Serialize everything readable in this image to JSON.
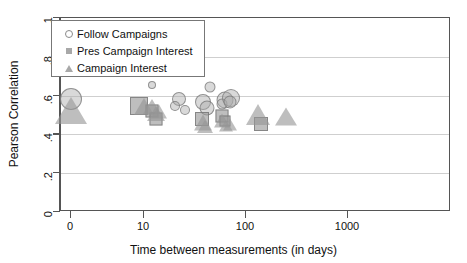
{
  "chart_data": {
    "type": "scatter",
    "title": "",
    "xlabel": "Time between measurements (in days)",
    "ylabel": "Pearson Correlation",
    "xscale": "log",
    "yscale": "linear",
    "ylim": [
      0,
      1
    ],
    "xlim": [
      0,
      1000
    ],
    "grid": "horizontal",
    "legend_position": "upper-left",
    "xticks": [
      {
        "value": 0,
        "label": "0"
      },
      {
        "value": 10,
        "label": "10"
      },
      {
        "value": 100,
        "label": "100"
      },
      {
        "value": 1000,
        "label": "1000"
      }
    ],
    "yticks": [
      {
        "value": 0,
        "label": "0"
      },
      {
        "value": 0.2,
        "label": ".2"
      },
      {
        "value": 0.4,
        "label": ".4"
      },
      {
        "value": 0.6,
        "label": ".6"
      },
      {
        "value": 0.8,
        "label": ".8"
      },
      {
        "value": 1,
        "label": "1"
      }
    ],
    "series": [
      {
        "name": "Follow Campaigns",
        "marker": "circle",
        "points": [
          {
            "x": 0,
            "y": 0.585,
            "size": 22
          },
          {
            "x": 12,
            "y": 0.655,
            "size": 8
          },
          {
            "x": 22,
            "y": 0.585,
            "size": 14
          },
          {
            "x": 20,
            "y": 0.545,
            "size": 10
          },
          {
            "x": 25,
            "y": 0.525,
            "size": 10
          },
          {
            "x": 44,
            "y": 0.645,
            "size": 11
          },
          {
            "x": 38,
            "y": 0.565,
            "size": 16
          },
          {
            "x": 41,
            "y": 0.535,
            "size": 15
          },
          {
            "x": 62,
            "y": 0.575,
            "size": 17
          },
          {
            "x": 58,
            "y": 0.555,
            "size": 11
          },
          {
            "x": 72,
            "y": 0.59,
            "size": 18
          },
          {
            "x": 70,
            "y": 0.565,
            "size": 13
          }
        ]
      },
      {
        "name": "Pres Campaign Interest",
        "marker": "square",
        "points": [
          {
            "x": 9,
            "y": 0.545,
            "size": 18
          },
          {
            "x": 12,
            "y": 0.52,
            "size": 13
          },
          {
            "x": 13,
            "y": 0.48,
            "size": 13
          },
          {
            "x": 37,
            "y": 0.48,
            "size": 14
          },
          {
            "x": 58,
            "y": 0.495,
            "size": 13
          },
          {
            "x": 62,
            "y": 0.47,
            "size": 11
          },
          {
            "x": 140,
            "y": 0.455,
            "size": 14
          }
        ]
      },
      {
        "name": "Campaign Interest",
        "marker": "triangle",
        "points": [
          {
            "x": 0,
            "y": 0.515,
            "size": 26
          },
          {
            "x": 10,
            "y": 0.545,
            "size": 17
          },
          {
            "x": 12,
            "y": 0.545,
            "size": 15
          },
          {
            "x": 13,
            "y": 0.51,
            "size": 15
          },
          {
            "x": 14,
            "y": 0.52,
            "size": 14
          },
          {
            "x": 38,
            "y": 0.46,
            "size": 16
          },
          {
            "x": 40,
            "y": 0.44,
            "size": 13
          },
          {
            "x": 58,
            "y": 0.47,
            "size": 14
          },
          {
            "x": 64,
            "y": 0.45,
            "size": 12
          },
          {
            "x": 70,
            "y": 0.455,
            "size": 12
          },
          {
            "x": 130,
            "y": 0.5,
            "size": 20
          },
          {
            "x": 245,
            "y": 0.49,
            "size": 18
          }
        ]
      }
    ]
  },
  "legend": {
    "items": [
      {
        "label": "Follow Campaigns",
        "marker": "circle"
      },
      {
        "label": "Pres Campaign Interest",
        "marker": "square"
      },
      {
        "label": "Campaign Interest",
        "marker": "triangle"
      }
    ]
  }
}
